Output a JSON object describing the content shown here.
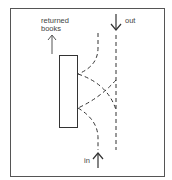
{
  "diagram": {
    "labels": {
      "returned_line1": "returned",
      "returned_line2": "books",
      "out": "out",
      "in": "in"
    },
    "colors": {
      "stroke": "#3a3a3a",
      "frame": "#555555",
      "background": "#ffffff"
    }
  }
}
